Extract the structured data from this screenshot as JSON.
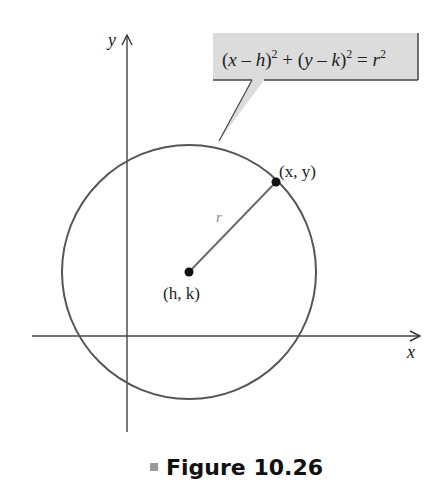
{
  "figure": {
    "caption": "Figure 10.26",
    "axes": {
      "x_label": "x",
      "y_label": "y"
    },
    "callout": {
      "equation_parts": [
        "(",
        "x",
        " – ",
        "h",
        ")",
        "2",
        " + (",
        "y",
        " – ",
        "k",
        ")",
        "2",
        " = ",
        "r",
        "2"
      ],
      "equation_text": "(x – h)^2 + (y – k)^2 = r^2"
    },
    "center_point": {
      "label": "(h, k)"
    },
    "circle_point": {
      "label": "(x, y)"
    },
    "radius_label": "r",
    "colors": {
      "circle": "#555555",
      "axes": "#444444",
      "callout_fill": "#dcdcdc",
      "radius_line": "#666666",
      "caption_marker": "#9a9a9a"
    }
  }
}
